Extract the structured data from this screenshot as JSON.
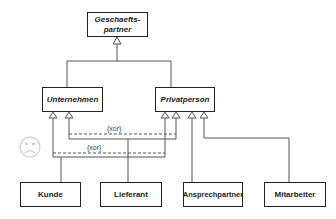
{
  "diagram": {
    "type": "UML class diagram (generalization)",
    "classes": {
      "root": {
        "label": "Geschaefts-\npartner",
        "line1": "Geschaefts-",
        "line2": "partner",
        "abstract": true
      },
      "unternehmen": {
        "label": "Unternehmen",
        "abstract": true
      },
      "privatperson": {
        "label": "Privatperson",
        "abstract": true
      },
      "kunde": {
        "label": "Kunde"
      },
      "lieferant": {
        "label": "Lieferant"
      },
      "ansprechpartner": {
        "label": "Ansprechpartner"
      },
      "mitarbeiter": {
        "label": "Mitarbeiter"
      }
    },
    "constraints": [
      {
        "label": "{xor}",
        "between": [
          "Lieferant→Unternehmen",
          "Lieferant→Privatperson"
        ]
      },
      {
        "label": "{xor}",
        "between": [
          "Kunde→Unternehmen",
          "Kunde→Privatperson"
        ]
      }
    ],
    "decorations": {
      "sad_face": "sad-face-icon"
    },
    "colors": {
      "line": "#555555",
      "box_border": "#222222",
      "face": "#cccccc"
    }
  }
}
